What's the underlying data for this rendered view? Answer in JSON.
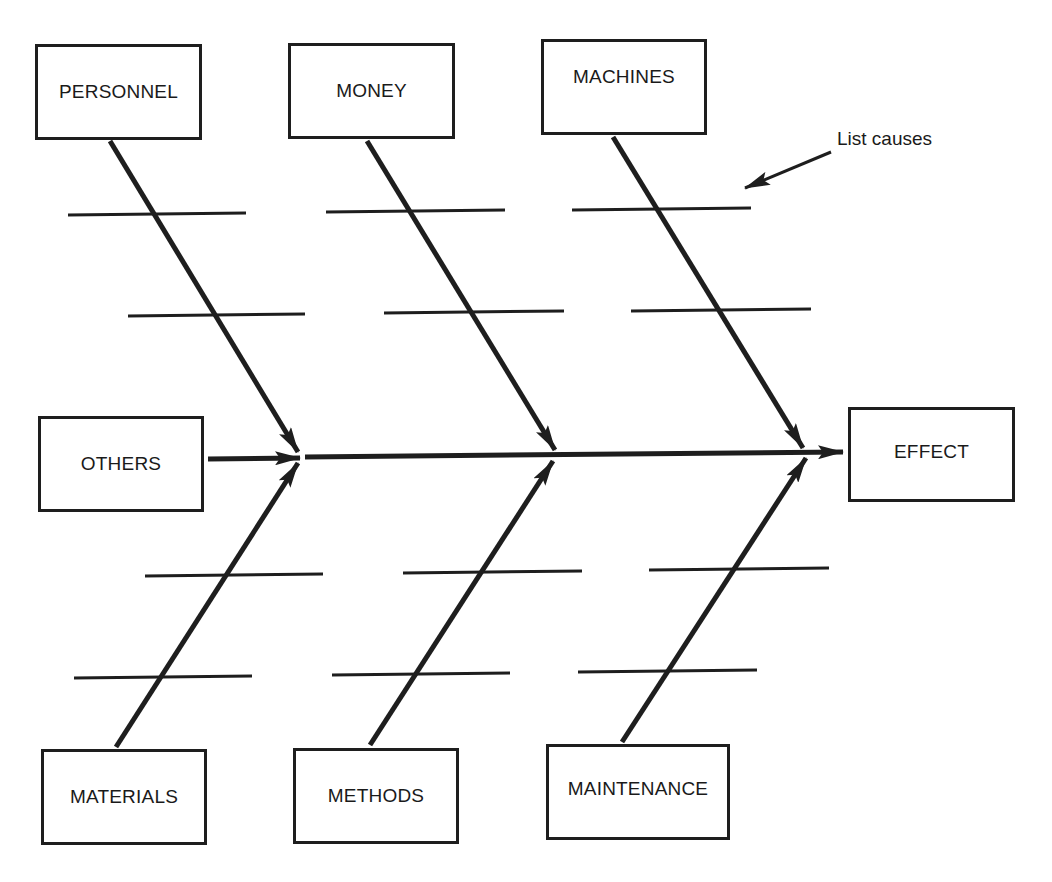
{
  "diagram": {
    "type": "fishbone (cause-and-effect)",
    "effect": {
      "label": "EFFECT"
    },
    "categories_top": [
      {
        "label": "PERSONNEL"
      },
      {
        "label": "MONEY"
      },
      {
        "label": "MACHINES"
      }
    ],
    "categories_bottom": [
      {
        "label": "MATERIALS"
      },
      {
        "label": "METHODS"
      },
      {
        "label": "MAINTENANCE"
      }
    ],
    "category_side": {
      "label": "OTHERS"
    },
    "annotation": {
      "label": "List causes"
    },
    "colors": {
      "stroke": "#1e1e1e",
      "background": "#ffffff"
    }
  }
}
